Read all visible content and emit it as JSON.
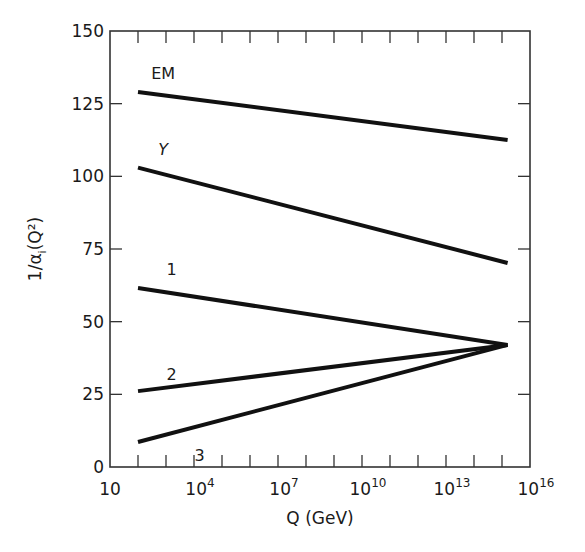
{
  "chart_data": {
    "type": "line",
    "title": "",
    "xlabel": "Q (GeV)",
    "ylabel": "1/α_i(Q²)",
    "xscale": "log",
    "xlim_log10": [
      1,
      16
    ],
    "ylim": [
      0,
      150
    ],
    "grid": false,
    "legend": "inline labels",
    "x_ticks": [
      {
        "log10": 1,
        "base": "10",
        "exp": ""
      },
      {
        "log10": 4,
        "base": "10",
        "exp": "4"
      },
      {
        "log10": 7,
        "base": "10",
        "exp": "7"
      },
      {
        "log10": 10,
        "base": "10",
        "exp": "10"
      },
      {
        "log10": 13,
        "base": "10",
        "exp": "13"
      },
      {
        "log10": 16,
        "base": "10",
        "exp": "16"
      }
    ],
    "y_ticks": [
      0,
      25,
      50,
      75,
      100,
      125,
      150
    ],
    "series": [
      {
        "name": "EM",
        "x_log10": [
          2,
          15.2
        ],
        "values": [
          129,
          112.5
        ],
        "label_at": [
          2.9,
          133.5
        ],
        "italic": false
      },
      {
        "name": "Y",
        "x_log10": [
          2,
          15.2
        ],
        "values": [
          103,
          70.2
        ],
        "label_at": [
          2.9,
          107.5
        ],
        "italic": true
      },
      {
        "name": "1",
        "x_log10": [
          2,
          15.2
        ],
        "values": [
          61.6,
          42
        ],
        "label_at": [
          3.2,
          66
        ],
        "italic": false
      },
      {
        "name": "2",
        "x_log10": [
          2,
          15.2
        ],
        "values": [
          26.1,
          42
        ],
        "label_at": [
          3.2,
          30
        ],
        "italic": false
      },
      {
        "name": "3",
        "x_log10": [
          2,
          15.2
        ],
        "values": [
          8.6,
          42
        ],
        "label_at": [
          4.2,
          2
        ],
        "italic": false
      }
    ],
    "annotations": [
      "Lines 1, 2, 3 converge near Q ≈ 10^15 GeV at 1/α ≈ 42"
    ]
  },
  "style": {
    "line_color": "#111111",
    "axis_color": "#333333",
    "background": "#ffffff"
  }
}
